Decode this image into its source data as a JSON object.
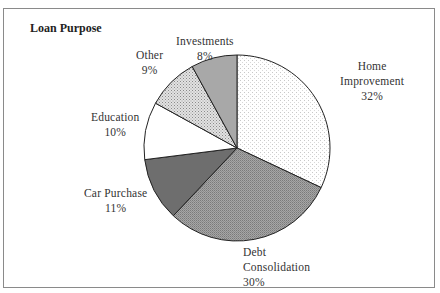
{
  "chart_data": {
    "type": "pie",
    "title": "Loan Purpose",
    "categories": [
      "Home Improvement",
      "Debt Consolidation",
      "Car Purchase",
      "Education",
      "Other",
      "Investments"
    ],
    "values": [
      32,
      30,
      11,
      10,
      9,
      8
    ],
    "unit": "%",
    "start_angle": "12 o'clock, clockwise",
    "legend": "none (data labels)",
    "labels": [
      {
        "name_lines": [
          "Home",
          "Improvement"
        ],
        "pct": "32%"
      },
      {
        "name_lines": [
          "Debt",
          "Consolidation"
        ],
        "pct": "30%"
      },
      {
        "name_lines": [
          "Car Purchase"
        ],
        "pct": "11%"
      },
      {
        "name_lines": [
          "Education"
        ],
        "pct": "10%"
      },
      {
        "name_lines": [
          "Other"
        ],
        "pct": "9%"
      },
      {
        "name_lines": [
          "Investments"
        ],
        "pct": "8%"
      }
    ],
    "fills": [
      "light-dotted",
      "medium-gray-dense",
      "dark-gray",
      "white",
      "light-stipple",
      "gray"
    ]
  }
}
